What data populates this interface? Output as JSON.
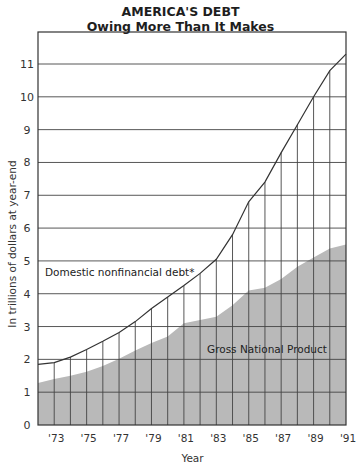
{
  "chart_data": {
    "type": "area",
    "title": "AMERICA'S DEBT",
    "subtitle": "Owing More Than It Makes",
    "xlabel": "Year",
    "ylabel": "In trillions of dollars at year-end",
    "ylim": [
      0,
      12
    ],
    "yticks": [
      0,
      1,
      2,
      3,
      4,
      5,
      6,
      7,
      8,
      9,
      10,
      11
    ],
    "xticks": [
      "'73",
      "'75",
      "'77",
      "'79",
      "'81",
      "'83",
      "'85",
      "'87",
      "'89",
      "'91"
    ],
    "grid": true,
    "x": [
      1972,
      1973,
      1974,
      1975,
      1976,
      1977,
      1978,
      1979,
      1980,
      1981,
      1982,
      1983,
      1984,
      1985,
      1986,
      1987,
      1988,
      1989,
      1990,
      1991
    ],
    "series": [
      {
        "name": "Domestic nonfinancial debt*",
        "style": "line",
        "values": [
          1.85,
          1.9,
          2.07,
          2.3,
          2.55,
          2.82,
          3.15,
          3.55,
          3.9,
          4.25,
          4.62,
          5.05,
          5.8,
          6.8,
          7.4,
          8.3,
          9.15,
          10.0,
          10.8,
          11.3
        ]
      },
      {
        "name": "Gross National Product",
        "style": "filled-area",
        "values": [
          1.28,
          1.4,
          1.5,
          1.62,
          1.8,
          2.02,
          2.27,
          2.5,
          2.7,
          3.1,
          3.2,
          3.3,
          3.65,
          4.1,
          4.18,
          4.45,
          4.82,
          5.1,
          5.38,
          5.5
        ]
      }
    ],
    "annotations": [
      {
        "text": "Domestic nonfinancial debt*",
        "x": 1972.3,
        "y": 4.75
      },
      {
        "text": "Gross National Product",
        "x": 1983.0,
        "y": 2.3
      }
    ],
    "colors": {
      "area_fill": "#b9b9b9",
      "line": "#333333",
      "grid": "#444444"
    }
  }
}
